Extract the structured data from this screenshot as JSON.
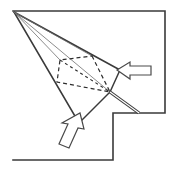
{
  "figure": {
    "title": "Perspective projection line diagram",
    "background_color": "#ffffff",
    "line_color": "#3a3a3a",
    "thin_line_color": "#6e6e6e",
    "dash_color": "#2d2d2d",
    "arrow_fill": "#ffffff",
    "arrow_stroke": "#4a4a4a"
  },
  "outline": {
    "name": "step-frame-outline",
    "stroke_width": 1.6,
    "points": "13,11 165,11 165,113 113,113 113,160 13,160"
  },
  "apex": {
    "name": "projection-apex",
    "x": 14,
    "y": 12,
    "label": "apex"
  },
  "convergence": {
    "name": "convergence-point",
    "x": 110,
    "y": 92
  },
  "rays": [
    {
      "name": "ray-upper-edge",
      "x1": 14,
      "y1": 12,
      "x2": 120,
      "y2": 70,
      "width": 1.5,
      "shade": "dark"
    },
    {
      "name": "ray-lower-edge",
      "x1": 14,
      "y1": 12,
      "x2": 79,
      "y2": 123,
      "width": 1.5,
      "shade": "dark"
    },
    {
      "name": "ray-to-base-far",
      "x1": 14,
      "y1": 12,
      "x2": 92,
      "y2": 56,
      "width": 0.8,
      "shade": "thin"
    },
    {
      "name": "ray-to-apex-mid",
      "x1": 14,
      "y1": 12,
      "x2": 110,
      "y2": 92,
      "width": 0.8,
      "shade": "thin"
    },
    {
      "name": "ray-to-base-near",
      "x1": 14,
      "y1": 12,
      "x2": 60,
      "y2": 60,
      "width": 0.8,
      "shade": "thin"
    }
  ],
  "solid_edges": [
    {
      "name": "edge-right-to-convergence",
      "x1": 120,
      "y1": 70,
      "x2": 110,
      "y2": 92,
      "width": 1.5
    },
    {
      "name": "edge-bottom-to-convergence",
      "x1": 79,
      "y1": 123,
      "x2": 110,
      "y2": 92,
      "width": 1.5
    }
  ],
  "dashed_base": {
    "name": "hidden-base-quadrilateral",
    "stroke_width": 1.2,
    "dash_pattern": "4 3",
    "points": "92,56 110,92 57,82 60,60"
  },
  "dashed_internal": [
    {
      "name": "dashed-diagonal-base",
      "x1": 60,
      "y1": 60,
      "x2": 110,
      "y2": 92,
      "dash": "3 3"
    }
  ],
  "double_line": {
    "name": "thick-double-edge",
    "x1": 110,
    "y1": 92,
    "x2": 139,
    "y2": 113,
    "outer_width": 3.2,
    "inner_width": 1.2
  },
  "arrows": [
    {
      "name": "arrow-right-pointing-left",
      "label": "right load arrow",
      "direction": "left",
      "fill": "#ffffff",
      "stroke": "#4a4a4a",
      "stroke_width": 1.2,
      "points": "117,70 130,62 130,66 151,66 151,75 130,75 130,79"
    },
    {
      "name": "arrow-bottom-pointing-up-right",
      "label": "bottom load arrow",
      "direction": "up-right",
      "fill": "#ffffff",
      "stroke": "#4a4a4a",
      "stroke_width": 1.2,
      "points": "80,113 84,129 78,128 69,148 59,144 68,124 62,123"
    }
  ]
}
